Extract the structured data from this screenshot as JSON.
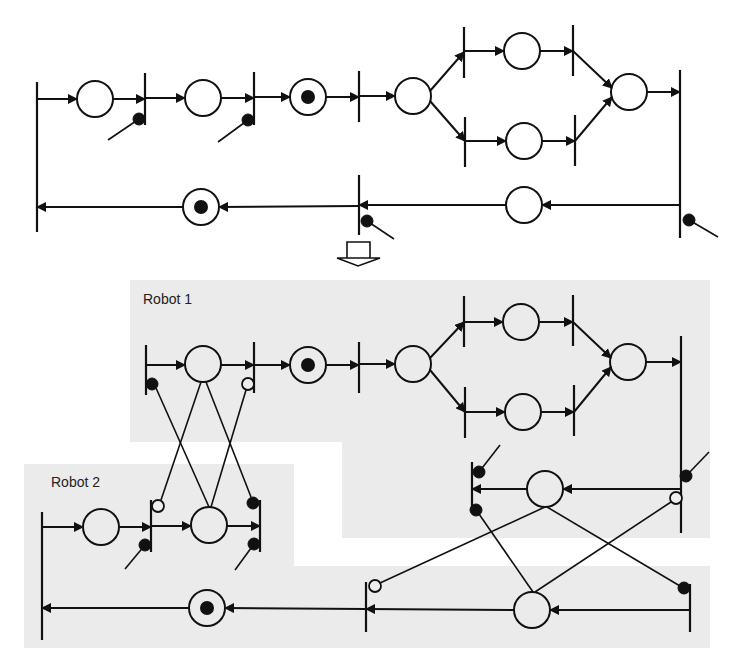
{
  "diagram": {
    "type": "petri-net-decomposition",
    "transform_arrow": "down-arrow",
    "regions": [
      {
        "id": "robot1",
        "label": "Robot 1"
      },
      {
        "id": "robot2",
        "label": "Robot 2"
      }
    ],
    "top_net": {
      "description": "single-robot cyclic Petri net with fork/join",
      "places": 10,
      "marked_places": 2,
      "transitions": 9,
      "inhibitor_inputs": 4
    },
    "bottom_net": {
      "description": "two-robot decomposed Petri net with cross-synchronization arcs",
      "marked_places": 2
    }
  },
  "colors": {
    "stroke": "#111111",
    "region_fill": "#ebebeb",
    "background": "#ffffff"
  }
}
